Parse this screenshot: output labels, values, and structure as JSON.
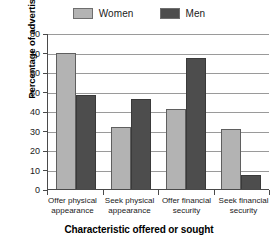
{
  "chart_data": {
    "type": "bar",
    "title": "",
    "categories": [
      "Offer physical appearance",
      "Seek physical appearance",
      "Offer financial security",
      "Seek financial security"
    ],
    "series": [
      {
        "name": "Women",
        "values": [
          70,
          32,
          41,
          31
        ],
        "color": "#b3b3b3"
      },
      {
        "name": "Men",
        "values": [
          48,
          46,
          67,
          7
        ],
        "color": "#4d4d4d"
      }
    ],
    "xlabel": "Characteristic offered or sought",
    "ylabel": "Percentage of advertisements",
    "ylim": [
      0,
      80
    ],
    "yticks": [
      0,
      10,
      20,
      30,
      40,
      50,
      60,
      70,
      80
    ],
    "ytick_labels": [
      "0",
      "10",
      "20",
      "30",
      "40",
      "50",
      "60",
      "70",
      "80"
    ],
    "grid": "horizontal",
    "legend_position": "top-center"
  },
  "legend": {
    "entries": [
      {
        "label": "Women"
      },
      {
        "label": "Men"
      }
    ]
  },
  "axes": {
    "y_title": "Percentage of advertisements",
    "x_title": "Characteristic offered or sought"
  },
  "x_labels": [
    {
      "line1": "Offer physical",
      "line2": "appearance"
    },
    {
      "line1": "Seek physical",
      "line2": "appearance"
    },
    {
      "line1": "Offer financial",
      "line2": "security"
    },
    {
      "line1": "Seek financial",
      "line2": "security"
    }
  ]
}
